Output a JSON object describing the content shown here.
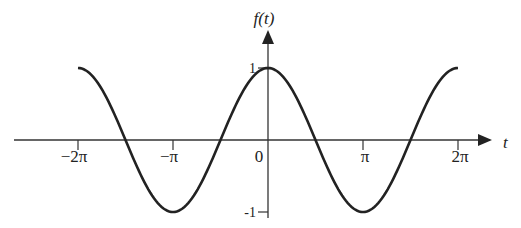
{
  "chart_data": {
    "type": "line",
    "title": "",
    "function": "cos(t)",
    "xlabel": "t",
    "ylabel": "f(t)",
    "xlim": [
      -6.2832,
      6.2832
    ],
    "ylim": [
      -1,
      1
    ],
    "x_ticks": [
      {
        "value": -6.2832,
        "label": "−2π"
      },
      {
        "value": -3.1416,
        "label": "−π"
      },
      {
        "value": 3.1416,
        "label": "π"
      },
      {
        "value": 6.2832,
        "label": "2π"
      }
    ],
    "origin_label": "0",
    "y_ticks": [
      {
        "value": 1,
        "label": "1"
      },
      {
        "value": -1,
        "label": "-1"
      }
    ],
    "series": [
      {
        "name": "f(t) = cos(t)",
        "x_range": [
          -6.2832,
          6.2832
        ],
        "samples": 200
      }
    ],
    "grid": false,
    "legend": "none"
  }
}
